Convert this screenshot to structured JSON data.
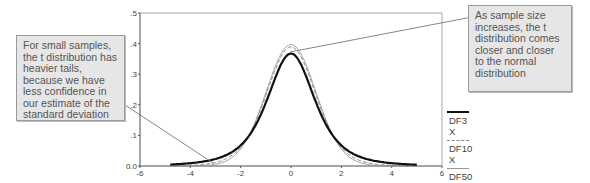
{
  "chart_data": {
    "type": "line",
    "title": "",
    "xlabel": "",
    "ylabel": "",
    "xlim": [
      -6,
      6
    ],
    "ylim": [
      0.0,
      0.5
    ],
    "x_ticks": [
      "-6",
      "-4",
      "-2",
      "0",
      "2",
      "4",
      "6"
    ],
    "y_ticks": [
      "0.0",
      ".1",
      ".2",
      ".3",
      ".4",
      ".5"
    ],
    "grid": false,
    "legend_position": "right",
    "series": [
      {
        "name": "DF3",
        "sub": "X",
        "style": "thick solid black",
        "color": "#111111",
        "df": 3,
        "x": [
          -5,
          -4,
          -3,
          -2,
          -1,
          0,
          1,
          2,
          3,
          4,
          5
        ],
        "values": [
          0.004,
          0.009,
          0.023,
          0.068,
          0.207,
          0.368,
          0.207,
          0.068,
          0.023,
          0.009,
          0.004
        ]
      },
      {
        "name": "DF10",
        "sub": "X",
        "style": "dashed gray",
        "color": "#888888",
        "df": 10,
        "x": [
          -5,
          -4,
          -3,
          -2,
          -1,
          0,
          1,
          2,
          3,
          4,
          5
        ],
        "values": [
          0.0,
          0.002,
          0.011,
          0.061,
          0.23,
          0.389,
          0.23,
          0.061,
          0.011,
          0.002,
          0.0
        ]
      },
      {
        "name": "DF50",
        "sub": "X",
        "style": "thin solid gray",
        "color": "#999999",
        "df": 50,
        "x": [
          -5,
          -4,
          -3,
          -2,
          -1,
          0,
          1,
          2,
          3,
          4,
          5
        ],
        "values": [
          0.0,
          0.0,
          0.005,
          0.055,
          0.239,
          0.397,
          0.239,
          0.055,
          0.005,
          0.0,
          0.0
        ]
      }
    ],
    "annotations": [
      "For small samples, the t distribution has heavier tails, because we have less confidence in our estimate of the standard deviation",
      "As sample size increases, the t distribution comes closer and closer to the normal distribution"
    ]
  },
  "notes": {
    "left": "For small samples, the t distribution has heavier tails, because we have less confidence in our estimate of the standard deviation",
    "right": "As sample size increases, the t distribution comes closer and closer to the normal distribution"
  },
  "legend": [
    {
      "label": "DF3",
      "sub": "X"
    },
    {
      "label": "DF10",
      "sub": "X"
    },
    {
      "label": "DF50",
      "sub": "X"
    }
  ]
}
